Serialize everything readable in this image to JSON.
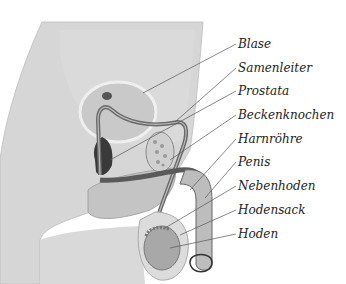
{
  "diagram": {
    "labels": [
      {
        "id": "blase",
        "text": "Blase"
      },
      {
        "id": "samenleiter",
        "text": "Samenleiter"
      },
      {
        "id": "prostata",
        "text": "Prostata"
      },
      {
        "id": "beckenknochen",
        "text": "Beckenknochen"
      },
      {
        "id": "harnroehre",
        "text": "Harnröhre"
      },
      {
        "id": "penis",
        "text": "Penis"
      },
      {
        "id": "nebenhoden",
        "text": "Nebenhoden"
      },
      {
        "id": "hodensack",
        "text": "Hodensack"
      },
      {
        "id": "hoden",
        "text": "Hoden"
      }
    ],
    "colors": {
      "body": "#d6d6d6",
      "body_light": "#e4e4e4",
      "bladder": "#c8c8c8",
      "tube": "#6a6a6a",
      "dark_tissue": "#3a3a3a",
      "testis": "#a8a8a8",
      "leader": "#555555"
    }
  }
}
